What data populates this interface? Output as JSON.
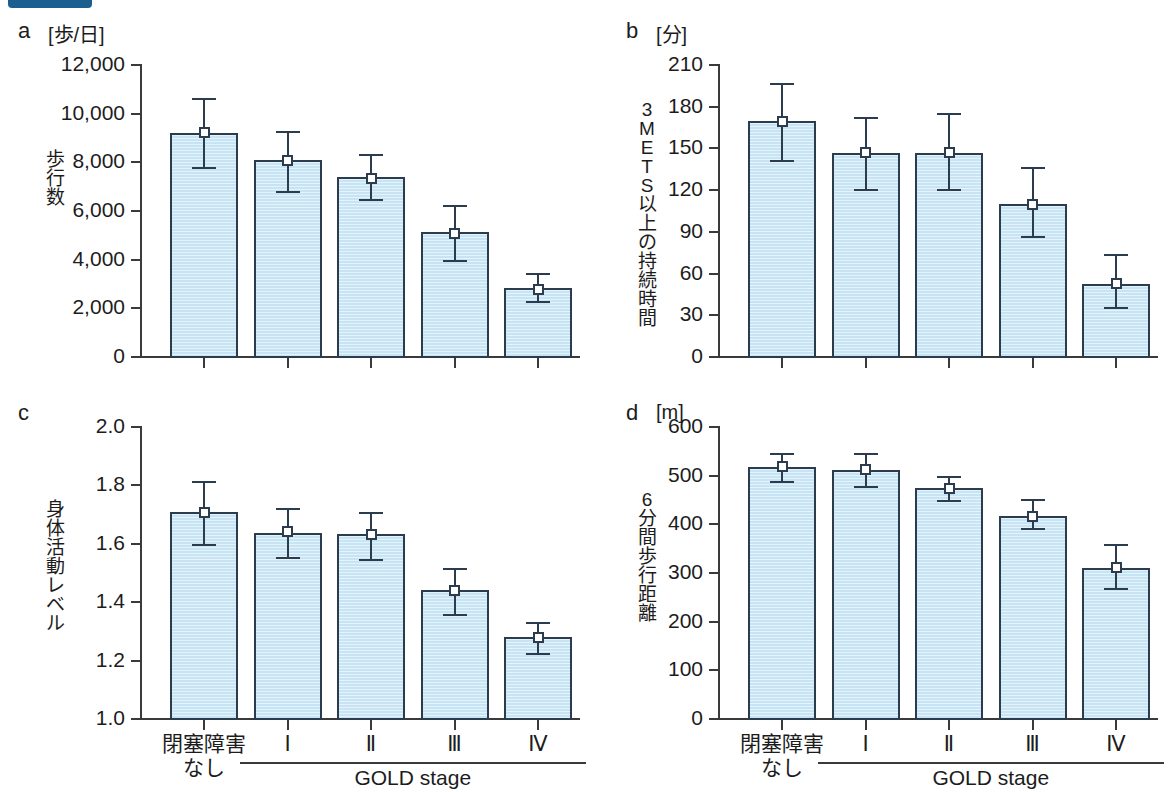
{
  "figure": {
    "badge": "",
    "group_label": "GOLD stage",
    "categories": [
      "閉塞障害\nなし",
      "Ⅰ",
      "Ⅱ",
      "Ⅲ",
      "Ⅳ"
    ]
  },
  "chart_data": [
    {
      "type": "bar",
      "panel": "a",
      "title": "",
      "unit": "[歩/日]",
      "ylabel": "歩行数",
      "xlabel": "GOLD stage",
      "categories": [
        "閉塞障害なし",
        "Ⅰ",
        "Ⅱ",
        "Ⅲ",
        "Ⅳ"
      ],
      "values": [
        9150,
        8050,
        7350,
        5100,
        2800
      ],
      "err_low": [
        7750,
        6800,
        6450,
        3950,
        2250
      ],
      "err_high": [
        10600,
        9250,
        8300,
        6200,
        3400
      ],
      "marker_values": [
        9200,
        8050,
        7300,
        5050,
        2750
      ],
      "ylim": [
        0,
        12000
      ],
      "yticks": [
        0,
        2000,
        4000,
        6000,
        8000,
        10000,
        12000
      ],
      "ytick_labels": [
        "0",
        "2,000",
        "4,000",
        "6,000",
        "8,000",
        "10,000",
        "12,000"
      ],
      "grid": false,
      "legend": "none"
    },
    {
      "type": "bar",
      "panel": "b",
      "title": "",
      "unit": "[分]",
      "ylabel": "3METS以上の持続時間",
      "ylabel_chars": [
        "3",
        "M",
        "E",
        "T",
        "S",
        "以",
        "上",
        "の",
        "持",
        "続",
        "時",
        "間"
      ],
      "xlabel": "GOLD stage",
      "categories": [
        "閉塞障害なし",
        "Ⅰ",
        "Ⅱ",
        "Ⅲ",
        "Ⅳ"
      ],
      "values": [
        169,
        146,
        146,
        109,
        52
      ],
      "err_low": [
        141,
        120,
        120,
        86,
        35
      ],
      "err_high": [
        196,
        172,
        175,
        136,
        73
      ],
      "marker_values": [
        169,
        146,
        146,
        109,
        52
      ],
      "ylim": [
        0,
        210
      ],
      "yticks": [
        0,
        30,
        60,
        90,
        120,
        150,
        180,
        210
      ],
      "ytick_labels": [
        "0",
        "30",
        "60",
        "90",
        "120",
        "150",
        "180",
        "210"
      ],
      "grid": false,
      "legend": "none"
    },
    {
      "type": "bar",
      "panel": "c",
      "title": "",
      "unit": "",
      "ylabel": "身体活動レベル",
      "ylabel_chars": [
        "身",
        "体",
        "活",
        "動",
        "レ",
        "ベ",
        "ル"
      ],
      "xlabel": "GOLD stage",
      "categories": [
        "閉塞障害なし",
        "Ⅰ",
        "Ⅱ",
        "Ⅲ",
        "Ⅳ"
      ],
      "values": [
        1.705,
        1.633,
        1.631,
        1.437,
        1.276
      ],
      "err_low": [
        1.597,
        1.551,
        1.546,
        1.357,
        1.224
      ],
      "err_high": [
        1.813,
        1.718,
        1.706,
        1.513,
        1.33
      ],
      "marker_values": [
        1.705,
        1.637,
        1.63,
        1.437,
        1.276
      ],
      "ylim": [
        1.0,
        2.0
      ],
      "yticks": [
        1.0,
        1.2,
        1.4,
        1.6,
        1.8,
        2.0
      ],
      "ytick_labels": [
        "1.0",
        "1.2",
        "1.4",
        "1.6",
        "1.8",
        "2.0"
      ],
      "grid": false,
      "legend": "none"
    },
    {
      "type": "bar",
      "panel": "d",
      "title": "",
      "unit": "[m]",
      "ylabel": "6分間歩行距離",
      "ylabel_chars": [
        "6",
        "分",
        "間",
        "歩",
        "行",
        "距",
        "離"
      ],
      "xlabel": "GOLD stage",
      "categories": [
        "閉塞障害なし",
        "Ⅰ",
        "Ⅱ",
        "Ⅲ",
        "Ⅳ"
      ],
      "values": [
        516,
        510,
        472,
        415,
        309
      ],
      "err_low": [
        487,
        477,
        447,
        391,
        267
      ],
      "err_high": [
        544,
        545,
        497,
        450,
        357
      ],
      "marker_values": [
        516,
        510,
        472,
        415,
        309
      ],
      "ylim": [
        0,
        600
      ],
      "yticks": [
        0,
        100,
        200,
        300,
        400,
        500,
        600
      ],
      "ytick_labels": [
        "0",
        "100",
        "200",
        "300",
        "400",
        "500",
        "600"
      ],
      "grid": false,
      "legend": "none"
    }
  ],
  "panels": {
    "a": {
      "letter": "a",
      "unit": "[歩/日]"
    },
    "b": {
      "letter": "b",
      "unit": "[分]"
    },
    "c": {
      "letter": "c",
      "unit": ""
    },
    "d": {
      "letter": "d",
      "unit": "[m]"
    }
  },
  "colors": {
    "bar_fill": "#c6e4f4",
    "bar_border": "#2a3c4e",
    "axis": "#3a3a3a",
    "badge": "#1a5f8f",
    "text": "#1c1c1c"
  }
}
